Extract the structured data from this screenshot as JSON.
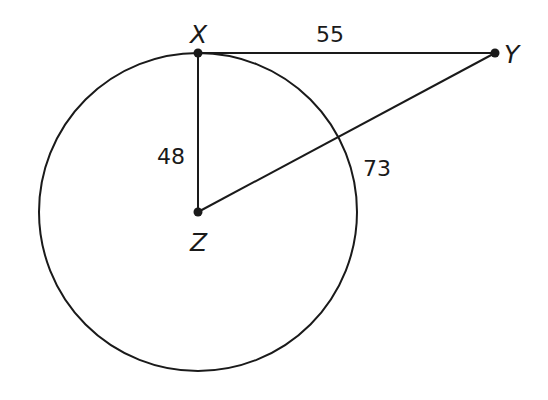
{
  "diagram": {
    "points": [
      {
        "name": "X",
        "x": 198,
        "y": 53
      },
      {
        "name": "Y",
        "x": 495,
        "y": 53
      },
      {
        "name": "Z",
        "x": 198,
        "y": 212
      }
    ],
    "circle": {
      "center": "Z",
      "radius": 159
    },
    "segments": [
      {
        "from": "X",
        "to": "Y",
        "label": "55"
      },
      {
        "from": "X",
        "to": "Z",
        "label": "48"
      },
      {
        "from": "Z",
        "to": "Y",
        "label": "73"
      }
    ],
    "labels": {
      "X": "X",
      "Y": "Y",
      "Z": "Z",
      "xy": "55",
      "xz": "48",
      "zy": "73"
    },
    "colors": {
      "stroke": "#1a1a1a",
      "background": "#ffffff"
    }
  }
}
